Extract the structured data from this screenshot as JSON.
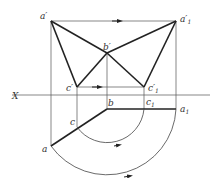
{
  "diagram": {
    "type": "descriptive-geometry-rotation",
    "axis_label": "X",
    "front_view": {
      "points": [
        {
          "id": "a_prime",
          "label": "a",
          "prime": true,
          "sub": ""
        },
        {
          "id": "a1_prime",
          "label": "a",
          "prime": true,
          "sub": "1"
        },
        {
          "id": "b_prime",
          "label": "b",
          "prime": true,
          "sub": ""
        },
        {
          "id": "c_prime",
          "label": "c",
          "prime": true,
          "sub": ""
        },
        {
          "id": "c1_prime",
          "label": "c",
          "prime": true,
          "sub": "1"
        }
      ],
      "edges": [
        [
          "a_prime",
          "b_prime"
        ],
        [
          "b_prime",
          "c_prime"
        ],
        [
          "a_prime",
          "c_prime"
        ],
        [
          "a1_prime",
          "b_prime"
        ],
        [
          "b_prime",
          "c1_prime"
        ],
        [
          "a1_prime",
          "c1_prime"
        ]
      ],
      "motion_arrows": [
        "a_prime -> a1_prime",
        "c_prime -> c1_prime"
      ]
    },
    "top_view": {
      "points": [
        {
          "id": "a",
          "label": "a",
          "sub": ""
        },
        {
          "id": "b",
          "label": "b",
          "sub": ""
        },
        {
          "id": "c",
          "label": "c",
          "sub": ""
        },
        {
          "id": "c1",
          "label": "c",
          "sub": "1"
        },
        {
          "id": "a1",
          "label": "a",
          "sub": "1"
        }
      ],
      "edges": [
        [
          "a",
          "b"
        ],
        [
          "b",
          "a1"
        ]
      ],
      "rotation_arcs": [
        "c -> c1 about b",
        "a -> a1 about b"
      ]
    }
  }
}
